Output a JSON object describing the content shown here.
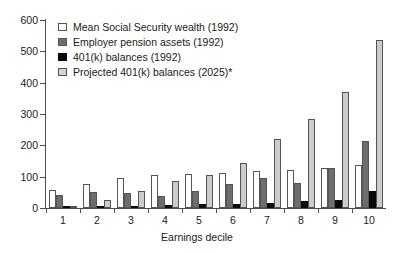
{
  "chart_data": {
    "type": "bar",
    "title": "",
    "xlabel": "Earnings decile",
    "ylabel": "",
    "categories": [
      "1",
      "2",
      "3",
      "4",
      "5",
      "6",
      "7",
      "8",
      "9",
      "10"
    ],
    "ylim": [
      0,
      600
    ],
    "yticks": [
      0,
      100,
      200,
      300,
      400,
      500,
      600
    ],
    "ytick_labels": [
      "0",
      "100",
      "200",
      "300",
      "400",
      "500",
      "600"
    ],
    "grid": false,
    "legend_position": "top-left",
    "series": [
      {
        "name": "Mean Social Security wealth (1992)",
        "color": "#ffffff",
        "values": [
          57,
          78,
          95,
          105,
          110,
          113,
          117,
          120,
          128,
          138
        ]
      },
      {
        "name": "Employer pension assets (1992)",
        "color": "#6e6e6e",
        "values": [
          42,
          51,
          48,
          38,
          55,
          75,
          95,
          80,
          128,
          215
        ]
      },
      {
        "name": "401(k) balances (1992)",
        "color": "#0a0a0a",
        "values": [
          3,
          5,
          6,
          8,
          12,
          13,
          15,
          22,
          27,
          53
        ]
      },
      {
        "name": "Projected 401(k) balances (2025)*",
        "color": "#cccccc",
        "values": [
          5,
          25,
          55,
          85,
          105,
          145,
          220,
          283,
          370,
          535
        ]
      }
    ]
  },
  "legend": {
    "items": [
      {
        "label": "Mean Social Security wealth (1992)",
        "swatch": "legend-swatch-open"
      },
      {
        "label": "Employer pension assets (1992)",
        "swatch": "legend-swatch-dark-gray"
      },
      {
        "label": "401(k) balances (1992)",
        "swatch": "legend-swatch-black"
      },
      {
        "label": "Projected 401(k) balances (2025)*",
        "swatch": "legend-swatch-light-gray"
      }
    ]
  },
  "axes": {
    "x_title": "Earnings decile",
    "y_labels": [
      "600",
      "500",
      "400",
      "300",
      "200",
      "100",
      "0"
    ],
    "x_labels": [
      "1",
      "2",
      "3",
      "4",
      "5",
      "6",
      "7",
      "8",
      "9",
      "10"
    ]
  }
}
